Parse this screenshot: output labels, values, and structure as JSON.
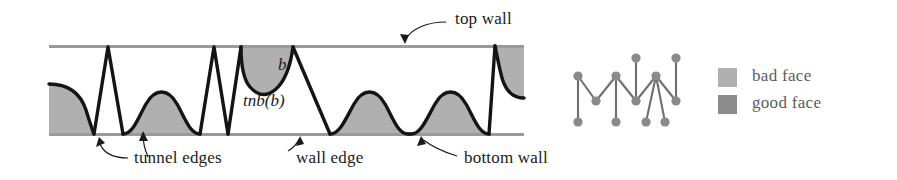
{
  "figure": {
    "kind": "tunnel-and-wall-diagram",
    "background_color": "#ffffff",
    "colors": {
      "wall_line": "#9a9a9a",
      "bad_face_fill": "#b0b0b0",
      "good_face_fill": "#8c8c8c",
      "tunnel_edge_stroke": "#141414",
      "graph_node": "#8a8a8a",
      "graph_edge": "#6f6f6f",
      "annotation_text": "#1a1a1a",
      "legend_text": "#5c5c5c"
    }
  },
  "annotations": {
    "top_wall": "top wall",
    "bottom_wall": "bottom wall",
    "tunnel_edges": "tunnel edges",
    "wall_edge": "wall edge"
  },
  "math_labels": {
    "b": "b",
    "tnb": "tnb(b)"
  },
  "legend": {
    "items": [
      {
        "label": "bad face",
        "color": "#b0b0b0"
      },
      {
        "label": "good face",
        "color": "#8c8c8c"
      }
    ]
  },
  "graph": {
    "nodes": [
      {
        "id": "n0",
        "x": 578,
        "y": 76
      },
      {
        "id": "n1",
        "x": 578,
        "y": 122
      },
      {
        "id": "n2",
        "x": 596,
        "y": 101
      },
      {
        "id": "n3",
        "x": 616,
        "y": 76
      },
      {
        "id": "n4",
        "x": 616,
        "y": 122
      },
      {
        "id": "n5",
        "x": 636,
        "y": 101
      },
      {
        "id": "n6",
        "x": 636,
        "y": 58
      },
      {
        "id": "n7",
        "x": 656,
        "y": 76
      },
      {
        "id": "n8",
        "x": 646,
        "y": 122
      },
      {
        "id": "n9",
        "x": 665,
        "y": 122
      },
      {
        "id": "n10",
        "x": 676,
        "y": 101
      },
      {
        "id": "n11",
        "x": 676,
        "y": 58
      }
    ],
    "edges": [
      [
        "n0",
        "n1"
      ],
      [
        "n0",
        "n2"
      ],
      [
        "n2",
        "n3"
      ],
      [
        "n3",
        "n4"
      ],
      [
        "n3",
        "n5"
      ],
      [
        "n5",
        "n6"
      ],
      [
        "n5",
        "n7"
      ],
      [
        "n7",
        "n8"
      ],
      [
        "n7",
        "n9"
      ],
      [
        "n7",
        "n10"
      ],
      [
        "n10",
        "n11"
      ]
    ]
  }
}
